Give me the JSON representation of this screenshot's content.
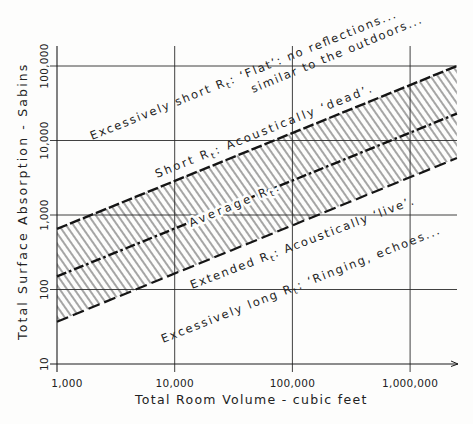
{
  "chart_data": {
    "type": "line",
    "title": "",
    "xlabel": "Total Room Volume - cubic feet",
    "ylabel": "Total Surface Absorption - Sabins",
    "x_scale": "log",
    "y_scale": "log",
    "xlim": [
      1000,
      2500000
    ],
    "ylim": [
      10,
      100000
    ],
    "grid": true,
    "legend": "none (inline annotations)",
    "x_ticks": [
      1000,
      10000,
      100000,
      1000000
    ],
    "x_tick_labels": [
      "1,000",
      "10,000",
      "100,000",
      "1,000,000"
    ],
    "y_ticks": [
      10,
      100,
      1000,
      10000,
      100000
    ],
    "y_tick_labels": [
      "10",
      "100",
      "1,000",
      "10,000",
      "100,000"
    ],
    "series": [
      {
        "id": "upper",
        "name": "Short Rt boundary",
        "style": "dashed",
        "x": [
          1000,
          2500000
        ],
        "y": [
          650,
          100000
        ]
      },
      {
        "id": "mid",
        "name": "Average Rt",
        "style": "dash-dot",
        "x": [
          1000,
          2500000
        ],
        "y": [
          150,
          23000
        ]
      },
      {
        "id": "lower",
        "name": "Extended Rt boundary",
        "style": "dashed",
        "x": [
          1000,
          2500000
        ],
        "y": [
          37,
          5800
        ]
      }
    ],
    "shaded_band": {
      "between": [
        "upper",
        "lower"
      ],
      "pattern": "diagonal hatch"
    },
    "annotations": {
      "excessively_short": {
        "pre": "Excessively short R",
        "sub": "t",
        "post": ": ‘Flat’: no reflections..."
      },
      "excessively_short_2": {
        "text": "similar to the outdoors..."
      },
      "short": {
        "pre": "Short R",
        "sub": "t",
        "post": ": Acoustically ‘dead’."
      },
      "average": {
        "pre": "Average R",
        "sub": "t",
        "post": "."
      },
      "extended": {
        "pre": "Extended R",
        "sub": "t",
        "post": ": Acoustically ‘live’."
      },
      "excessively_long": {
        "pre": "Excessively long R",
        "sub": "t",
        "post": ": ‘Ringing, echoes..."
      }
    }
  }
}
